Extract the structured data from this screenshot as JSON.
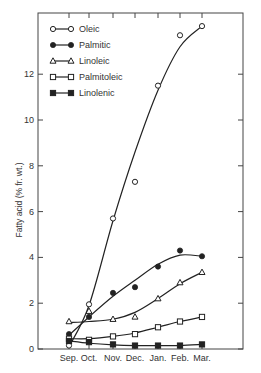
{
  "chart_data": {
    "type": "line",
    "title": "",
    "xlabel": "",
    "ylabel": "Fatty acid (% fr. wt.)",
    "categories": [
      "Sep.",
      "Oct.",
      "Nov.",
      "Dec.",
      "Jan.",
      "Feb.",
      "Mar."
    ],
    "ylim": [
      0,
      14.6
    ],
    "yticks": [
      0,
      2,
      4,
      6,
      8,
      10,
      12
    ],
    "ytick_labels": [
      "0",
      "2",
      "4",
      "6",
      "8",
      "10",
      "12"
    ],
    "grid": false,
    "legend_position": "upper left",
    "series": [
      {
        "name": "Oleic",
        "marker": "open-circle",
        "values": [
          0.15,
          1.95,
          5.7,
          7.3,
          11.5,
          13.7,
          14.1
        ]
      },
      {
        "name": "Palmitic",
        "marker": "filled-circle",
        "values": [
          0.65,
          1.4,
          2.45,
          2.7,
          3.6,
          4.3,
          4.05
        ]
      },
      {
        "name": "Linoleic",
        "marker": "open-triangle",
        "values": [
          1.2,
          1.65,
          1.3,
          1.4,
          2.2,
          2.9,
          3.35
        ]
      },
      {
        "name": "Palmitoleic",
        "marker": "open-square",
        "values": [
          0.45,
          0.4,
          0.55,
          0.65,
          0.95,
          1.2,
          1.4
        ]
      },
      {
        "name": "Linolenic",
        "marker": "filled-square",
        "values": [
          0.35,
          0.3,
          0.2,
          0.15,
          0.15,
          0.15,
          0.2
        ]
      }
    ]
  },
  "legend": {
    "items": [
      "Oleic",
      "Palmitic",
      "Linoleic",
      "Palmitoleic",
      "Linolenic"
    ]
  },
  "axis": {
    "ylabel": "Fatty acid (% fr. wt.)"
  }
}
